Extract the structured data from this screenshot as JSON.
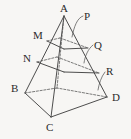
{
  "figure": {
    "kind": "geometry-diagram",
    "background_color": "#f7f6f4",
    "stroke_color": "#3a3a3a",
    "label_color": "#2b2b2b",
    "labels": [
      {
        "id": "A",
        "text": "A",
        "x": 60,
        "y": 3,
        "name": "vertex-label-a"
      },
      {
        "id": "P",
        "text": "P",
        "x": 84,
        "y": 11,
        "name": "vertex-label-p"
      },
      {
        "id": "M",
        "text": "M",
        "x": 33,
        "y": 30,
        "name": "vertex-label-m"
      },
      {
        "id": "Q",
        "text": "Q",
        "x": 94,
        "y": 40,
        "name": "vertex-label-q"
      },
      {
        "id": "N",
        "text": "N",
        "x": 23,
        "y": 53,
        "name": "vertex-label-n"
      },
      {
        "id": "R",
        "text": "R",
        "x": 106,
        "y": 66,
        "name": "vertex-label-r"
      },
      {
        "id": "B",
        "text": "B",
        "x": 11,
        "y": 83,
        "name": "vertex-label-b"
      },
      {
        "id": "D",
        "text": "D",
        "x": 112,
        "y": 92,
        "name": "vertex-label-d"
      },
      {
        "id": "C",
        "text": "C",
        "x": 46,
        "y": 122,
        "name": "vertex-label-c"
      }
    ],
    "points": {
      "A": [
        64,
        16
      ],
      "B": [
        25,
        93
      ],
      "C": [
        51,
        117
      ],
      "D": [
        107,
        97
      ],
      "E_back": [
        57,
        88
      ],
      "M": [
        47,
        41
      ],
      "Q": [
        88,
        48
      ],
      "N": [
        37,
        62
      ],
      "R": [
        99,
        73
      ],
      "P_tip": [
        72,
        37
      ],
      "M_back": [
        60,
        38
      ],
      "Q_back": [
        78,
        43
      ],
      "N_back": [
        57,
        57
      ],
      "R_back": [
        85,
        65
      ],
      "Mid_front_1": [
        64,
        49
      ],
      "Mid_front_2": [
        64,
        72
      ]
    },
    "solid_edges": [
      {
        "name": "edge-a-b",
        "from": "A",
        "to": "B"
      },
      {
        "name": "edge-a-c",
        "from": "A",
        "to": "C"
      },
      {
        "name": "edge-a-d",
        "from": "A",
        "to": "D"
      },
      {
        "name": "edge-b-c",
        "from": "B",
        "to": "C"
      },
      {
        "name": "edge-c-d",
        "from": "C",
        "to": "D"
      },
      {
        "name": "cross-section-upper-front-left",
        "from": "M",
        "to": "Mid_front_1"
      },
      {
        "name": "cross-section-upper-front-right",
        "from": "Mid_front_1",
        "to": "Q"
      },
      {
        "name": "cross-section-lower-front-left",
        "from": "N",
        "to": "Mid_front_2"
      },
      {
        "name": "cross-section-lower-front-right",
        "from": "Mid_front_2",
        "to": "R"
      }
    ],
    "dashed_edges": [
      {
        "name": "hidden-edge-b-back",
        "from": "B",
        "to": "E_back"
      },
      {
        "name": "hidden-edge-d-back",
        "from": "D",
        "to": "E_back"
      },
      {
        "name": "hidden-edge-a-back",
        "from": "A",
        "to": "E_back"
      },
      {
        "name": "hidden-cross-upper-left",
        "from": "M",
        "to": "M_back"
      },
      {
        "name": "hidden-cross-upper-right",
        "from": "M_back",
        "to": "Q"
      },
      {
        "name": "hidden-cross-lower-left",
        "from": "N",
        "to": "N_back"
      },
      {
        "name": "hidden-cross-lower-right",
        "from": "N_back",
        "to": "R"
      }
    ],
    "leader_lines": [
      {
        "name": "leader-line-p",
        "label": "P",
        "d": "M83,16 C77,18 74,27 72,37"
      },
      {
        "name": "leader-line-q",
        "label": "Q",
        "d": "M93,45 C88,49 85,56 84,63"
      },
      {
        "name": "leader-line-r",
        "label": "R",
        "d": "M105,72 C101,77 99,84 98,90"
      }
    ]
  }
}
